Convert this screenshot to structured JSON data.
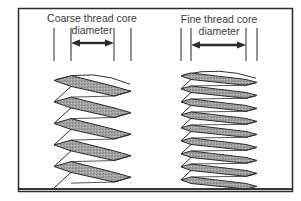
{
  "figure": {
    "colors": {
      "line": "#2b2b2b",
      "thread_shade": "#9a9a9a",
      "background": "#ffffff"
    },
    "panels": [
      {
        "id": "coarse",
        "title_line1": "Coarse thread core",
        "title_line2": "diameter",
        "outer_left_x": 54,
        "outer_right_x": 131,
        "core_left_x": 71,
        "core_right_x": 114,
        "pitch": 21.5,
        "thread_top_y": 74,
        "thread_bottom_y": 189,
        "arrow_y": 43
      },
      {
        "id": "fine",
        "title_line1": "Fine thread core",
        "title_line2": "diameter",
        "outer_left_x": 181,
        "outer_right_x": 257,
        "core_left_x": 191,
        "core_right_x": 246,
        "pitch": 13,
        "thread_top_y": 72,
        "thread_bottom_y": 189,
        "arrow_y": 45
      }
    ]
  }
}
